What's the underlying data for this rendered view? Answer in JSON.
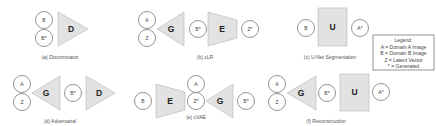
{
  "panels": {
    "a": {
      "caption": "(a) Discriminator",
      "inputs": [
        "B",
        "B*"
      ],
      "blocks": [
        "D"
      ]
    },
    "b": {
      "caption": "(b) cLR",
      "inputs": [
        "A",
        "Z"
      ],
      "blocks": [
        "G",
        "E"
      ],
      "intermediate": "B*",
      "output": "Z*"
    },
    "c": {
      "caption": "(c) U-Net Segmentation",
      "input": "B",
      "blocks": [
        "U"
      ],
      "output": "A*"
    },
    "d": {
      "caption": "(d) Adversarial",
      "inputs": [
        "A",
        "Z"
      ],
      "blocks": [
        "G",
        "D"
      ],
      "intermediate": "B*"
    },
    "e": {
      "caption": "(e) cVAE",
      "input": "B",
      "blocks": [
        "E",
        "G"
      ],
      "side_input": "A",
      "intermediate": "Z*",
      "output": "B*"
    },
    "f": {
      "caption": "(f) Reconstruction",
      "inputs": [
        "A",
        "Z"
      ],
      "blocks": [
        "G",
        "U"
      ],
      "intermediate": "B*",
      "output": "A*"
    }
  },
  "legend": {
    "title": "Legend:",
    "items": [
      "A = Domain A Image",
      "B = Domain B Image",
      "Z = Latent Vector",
      "* = Generated"
    ]
  },
  "colors": {
    "block_fill": "#e2e2e2",
    "block_stroke": "#b5b5b5",
    "circle_stroke": "#7a7a7a"
  }
}
